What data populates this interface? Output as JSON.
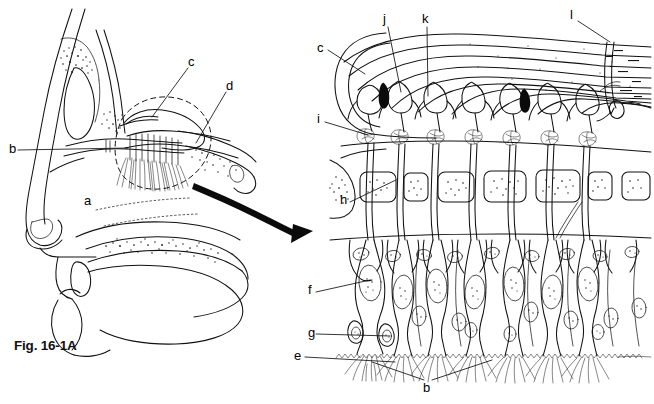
{
  "figure": {
    "caption": "Fig. 16-1A",
    "background_color": "#ffffff",
    "ink_color": "#111111"
  },
  "left_panel": {
    "name": "sagittal-head-section",
    "labels": [
      {
        "id": "a",
        "text": "a",
        "x": 84,
        "y": 201,
        "meaning": "nasal-cavity",
        "leader": false
      },
      {
        "id": "b",
        "text": "b",
        "x": 9,
        "y": 148,
        "meaning": "olfactory-nerve-fibers",
        "leader": true
      },
      {
        "id": "c",
        "text": "c",
        "x": 188,
        "y": 62,
        "meaning": "olfactory-bulb",
        "leader": true
      },
      {
        "id": "d",
        "text": "d",
        "x": 226,
        "y": 86,
        "meaning": "olfactory-epithelium-region",
        "leader": true
      }
    ]
  },
  "right_panel": {
    "name": "olfactory-epithelium-detail",
    "labels": [
      {
        "id": "c",
        "text": "c",
        "x": 317,
        "y": 48,
        "meaning": "olfactory-bulb",
        "leader": true
      },
      {
        "id": "j",
        "text": "j",
        "x": 383,
        "y": 19,
        "meaning": "mitral-cell",
        "leader": true
      },
      {
        "id": "k",
        "text": "k",
        "x": 422,
        "y": 19,
        "meaning": "tufted-cell",
        "leader": true
      },
      {
        "id": "l",
        "text": "l",
        "x": 570,
        "y": 14,
        "meaning": "olfactory-tract-axon-bundle",
        "leader": true
      },
      {
        "id": "i",
        "text": "i",
        "x": 317,
        "y": 118,
        "meaning": "glomerulus",
        "leader": true
      },
      {
        "id": "h",
        "text": "h",
        "x": 340,
        "y": 199,
        "meaning": "cribriform-plate",
        "leader": true
      },
      {
        "id": "f",
        "text": "f",
        "x": 308,
        "y": 288,
        "meaning": "olfactory-receptor-neuron",
        "leader": true
      },
      {
        "id": "g",
        "text": "g",
        "x": 308,
        "y": 330,
        "meaning": "basal-cell",
        "leader": true
      },
      {
        "id": "e",
        "text": "e",
        "x": 297,
        "y": 353,
        "meaning": "olfactory-mucosa-surface",
        "leader": true
      },
      {
        "id": "b",
        "text": "b",
        "x": 424,
        "y": 385,
        "meaning": "olfactory-cilia",
        "leader": true
      }
    ]
  },
  "arrow": {
    "name": "magnification-arrow",
    "style": "thick-curved-black-arrow",
    "from": [
      196,
      186
    ],
    "to": [
      308,
      228
    ]
  }
}
